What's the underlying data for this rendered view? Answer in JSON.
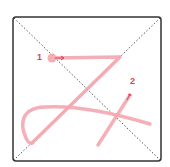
{
  "diagram": {
    "type": "stroke-order",
    "frame": {
      "x": 12,
      "y": 16,
      "width": 150,
      "height": 146,
      "border_color": "#333333",
      "guide_color": "#555555"
    },
    "stroke_color": "#f4a6ae",
    "label_color": "#e0405a",
    "strokes": [
      {
        "order": "1",
        "label_x": 38,
        "label_y": 53
      },
      {
        "order": "2",
        "label_x": 130,
        "label_y": 78
      }
    ]
  }
}
